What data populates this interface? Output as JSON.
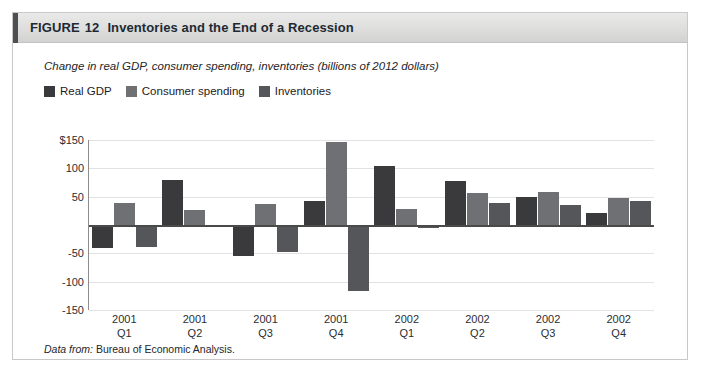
{
  "figure": {
    "label": "FIGURE",
    "number": "12",
    "title": "Inventories and the End of a Recession",
    "source_label": "Data from:",
    "source_text": "Bureau of Economic Analysis."
  },
  "colors": {
    "real_gdp": "#3a3a3c",
    "consumer_spending": "#6f7073",
    "inventories": "#55565a",
    "header_band": "#dededd",
    "header_accent": "#4d4f53",
    "zero_line": "#4a4a4a",
    "gridline": "#e2e2e2",
    "card_border": "#c8c8c8"
  },
  "chart_data": {
    "type": "bar",
    "title": "Inventories and the End of a Recession",
    "subtitle": "Change in real GDP, consumer spending, inventories (billions of 2012 dollars)",
    "xlabel": "",
    "ylabel": "",
    "ylim": [
      -150,
      150
    ],
    "yticks": [
      150,
      100,
      50,
      0,
      -50,
      -100,
      -150
    ],
    "ytick_labels": [
      "$150",
      "100",
      "50",
      "",
      "-50",
      "-100",
      "-150"
    ],
    "grid": true,
    "legend_position": "top-left",
    "categories": [
      "2001 Q1",
      "2001 Q2",
      "2001 Q3",
      "2001 Q4",
      "2002 Q1",
      "2002 Q2",
      "2002 Q3",
      "2002 Q4"
    ],
    "category_lines": [
      [
        "2001",
        "Q1"
      ],
      [
        "2001",
        "Q2"
      ],
      [
        "2001",
        "Q3"
      ],
      [
        "2001",
        "Q4"
      ],
      [
        "2002",
        "Q1"
      ],
      [
        "2002",
        "Q2"
      ],
      [
        "2002",
        "Q3"
      ],
      [
        "2002",
        "Q4"
      ]
    ],
    "series": [
      {
        "name": "Real GDP",
        "color": "#3a3a3c",
        "values": [
          -40,
          80,
          -55,
          42,
          105,
          77,
          50,
          22
        ]
      },
      {
        "name": "Consumer spending",
        "color": "#6f7073",
        "values": [
          38,
          27,
          37,
          147,
          28,
          57,
          58,
          47
        ]
      },
      {
        "name": "Inventories",
        "color": "#55565a",
        "values": [
          -38,
          -3,
          -48,
          -117,
          -5,
          38,
          35,
          43
        ]
      }
    ]
  }
}
